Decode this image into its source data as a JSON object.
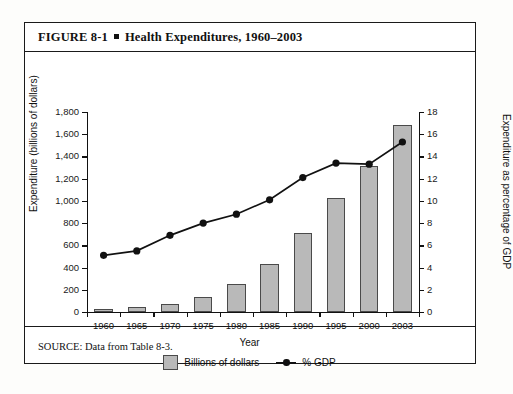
{
  "figure": {
    "number": "FIGURE 8-1",
    "bullet": "square-bullet",
    "title": "Health Expenditures, 1960–2003",
    "source": "SOURCE: Data from Table 8-3."
  },
  "legend": {
    "bars_label": "Billions of dollars",
    "line_label": "% GDP"
  },
  "colors": {
    "bar_fill": "#b9b9b9",
    "bar_edge": "#4a4a4a",
    "line": "#111111",
    "frame": "#1a1a1a",
    "background": "#ffffff"
  },
  "chart_data": {
    "type": "bar",
    "title": "Health Expenditures, 1960–2003",
    "xlabel": "Year",
    "ylabel": "Expenditure (billions of dollars)",
    "y2label": "Expenditure as percentage of GDP",
    "categories": [
      "1960",
      "1965",
      "1970",
      "1975",
      "1980",
      "1985",
      "1990",
      "1995",
      "2000",
      "2003"
    ],
    "series": [
      {
        "name": "Billions of dollars",
        "type": "bar",
        "axis": "left",
        "values": [
          27,
          42,
          75,
          133,
          255,
          429,
          714,
          1027,
          1310,
          1679
        ]
      },
      {
        "name": "% GDP",
        "type": "line",
        "axis": "right",
        "values": [
          5.1,
          5.5,
          6.9,
          8.0,
          8.8,
          10.1,
          12.1,
          13.4,
          13.3,
          15.3
        ]
      }
    ],
    "ylim": [
      0,
      1800
    ],
    "y2lim": [
      0,
      18
    ],
    "yticks": [
      "0",
      "200",
      "400",
      "600",
      "800",
      "1,000",
      "1,200",
      "1,400",
      "1,600",
      "1,800"
    ],
    "y2ticks": [
      "0",
      "2",
      "4",
      "6",
      "8",
      "10",
      "12",
      "14",
      "16",
      "18"
    ],
    "grid": false,
    "legend_position": "bottom-center"
  }
}
